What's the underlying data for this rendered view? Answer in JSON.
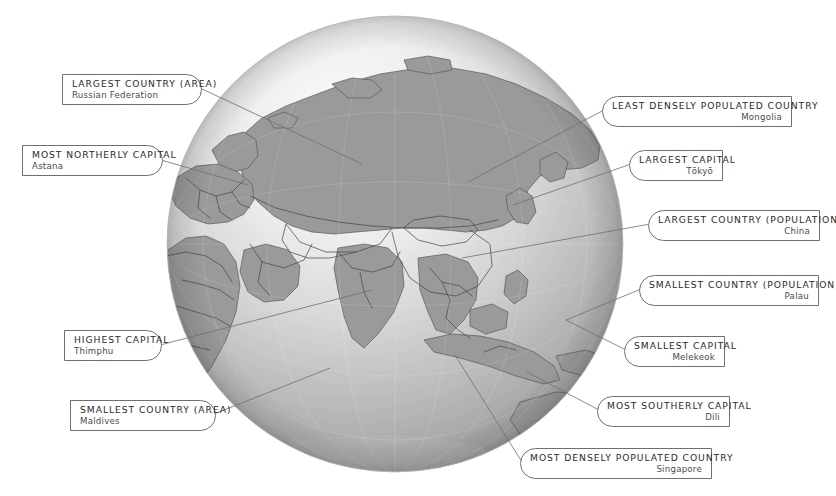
{
  "meta": {
    "background_color": "#ffffff",
    "label_border_color": "#6f6f6f",
    "label_header_color": "#2b2b2b",
    "label_value_color": "#4a4a4a",
    "leader_line_color": "#6f6f6f"
  },
  "globe": {
    "name": "world-globe",
    "projection": "orthographic",
    "view_center_region": "Asia",
    "ocean_color": "#ffffff",
    "land_color": "#9a9a9a",
    "border_color": "#4c4c4c",
    "sphere_shade_light": "#f2f2f2",
    "sphere_shade_dark": "#8e8e8e",
    "center_x": 395,
    "center_y": 244,
    "radius": 228
  },
  "callouts": [
    {
      "id": "largest-country-area",
      "header": "LARGEST COUNTRY (AREA)",
      "value": "Russian Federation",
      "align": "left",
      "shape": "round-right",
      "x": 62,
      "y": 74,
      "width": 140,
      "height": 31,
      "leader": {
        "x1": 200,
        "y1": 88,
        "x2": 362,
        "y2": 164
      }
    },
    {
      "id": "most-northerly-capital",
      "header": "MOST NORTHERLY CAPITAL",
      "value": "Astana",
      "align": "left",
      "shape": "round-right",
      "x": 22,
      "y": 145,
      "width": 141,
      "height": 31,
      "leader": {
        "x1": 161,
        "y1": 160,
        "x2": 248,
        "y2": 185
      }
    },
    {
      "id": "highest-capital",
      "header": "HIGHEST CAPITAL",
      "value": "Thimphu",
      "align": "left",
      "shape": "round-right",
      "x": 64,
      "y": 330,
      "width": 98,
      "height": 31,
      "leader": {
        "x1": 160,
        "y1": 345,
        "x2": 372,
        "y2": 290
      }
    },
    {
      "id": "smallest-country-area",
      "header": "SMALLEST COUNTRY (AREA)",
      "value": "Maldives",
      "align": "left",
      "shape": "round-right",
      "x": 70,
      "y": 400,
      "width": 146,
      "height": 31,
      "leader": {
        "x1": 214,
        "y1": 414,
        "x2": 330,
        "y2": 368
      }
    },
    {
      "id": "least-densely-populated-country",
      "header": "LEAST DENSELY POPULATED COUNTRY",
      "value": "Mongolia",
      "align": "right",
      "shape": "round-left",
      "x": 602,
      "y": 96,
      "width": 190,
      "height": 31,
      "leader": {
        "x1": 604,
        "y1": 110,
        "x2": 468,
        "y2": 182
      }
    },
    {
      "id": "largest-capital",
      "header": "LARGEST CAPITAL",
      "value": "Tōkyō",
      "align": "right",
      "shape": "round-left",
      "x": 629,
      "y": 150,
      "width": 94,
      "height": 31,
      "leader": {
        "x1": 631,
        "y1": 164,
        "x2": 513,
        "y2": 205
      }
    },
    {
      "id": "largest-country-population",
      "header": "LARGEST COUNTRY (POPULATION)",
      "value": "China",
      "align": "right",
      "shape": "round-left",
      "x": 648,
      "y": 210,
      "width": 172,
      "height": 31,
      "leader": {
        "x1": 650,
        "y1": 224,
        "x2": 462,
        "y2": 258
      }
    },
    {
      "id": "smallest-country-population",
      "header": "SMALLEST COUNTRY (POPULATION)",
      "value": "Palau",
      "align": "right",
      "shape": "round-left",
      "x": 639,
      "y": 275,
      "width": 180,
      "height": 31,
      "leader": {
        "x1": 641,
        "y1": 289,
        "x2": 566,
        "y2": 320
      }
    },
    {
      "id": "smallest-capital",
      "header": "SMALLEST CAPITAL",
      "value": "Melekeok",
      "align": "right",
      "shape": "round-left",
      "x": 624,
      "y": 336,
      "width": 101,
      "height": 31,
      "leader": {
        "x1": 626,
        "y1": 350,
        "x2": 566,
        "y2": 320
      }
    },
    {
      "id": "most-southerly-capital",
      "header": "MOST SOUTHERLY CAPITAL",
      "value": "Dili",
      "align": "right",
      "shape": "round-left",
      "x": 597,
      "y": 396,
      "width": 133,
      "height": 31,
      "leader": {
        "x1": 599,
        "y1": 410,
        "x2": 527,
        "y2": 372
      }
    },
    {
      "id": "most-densely-populated-country",
      "header": "MOST DENSELY POPULATED COUNTRY",
      "value": "Singapore",
      "align": "right",
      "shape": "round-left",
      "x": 520,
      "y": 448,
      "width": 192,
      "height": 31,
      "leader": {
        "x1": 522,
        "y1": 462,
        "x2": 455,
        "y2": 355
      }
    }
  ]
}
